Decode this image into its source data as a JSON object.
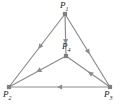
{
  "figure": {
    "type": "directed-graph",
    "caption": "",
    "background_color": "#ffffff",
    "edge_color": "#8d8d8d",
    "node_color": "#7f7f7f",
    "label_color": "#1a1a1a",
    "nodes": [
      {
        "id": "P1",
        "label_base": "P",
        "label_sub": "1",
        "x": 65,
        "y": 14
      },
      {
        "id": "P2",
        "label_base": "P",
        "label_sub": "2",
        "x": 9,
        "y": 87
      },
      {
        "id": "P3",
        "label_base": "P",
        "label_sub": "3",
        "x": 110,
        "y": 87
      },
      {
        "id": "P4",
        "label_base": "P",
        "label_sub": "4",
        "x": 66,
        "y": 56
      }
    ],
    "edges": [
      {
        "id": "e1",
        "from": "P1",
        "to": "P2",
        "directed": true,
        "arrow_t": 0.45
      },
      {
        "id": "e2",
        "from": "P1",
        "to": "P3",
        "directed": true,
        "arrow_t": 0.52
      },
      {
        "id": "e3",
        "from": "P1",
        "to": "P4",
        "directed": true,
        "arrow_t": 0.66
      },
      {
        "id": "e4",
        "from": "P3",
        "to": "P2",
        "directed": true,
        "arrow_t": 0.5
      },
      {
        "id": "e5",
        "from": "P3",
        "to": "P4",
        "directed": true,
        "arrow_t": 0.45
      },
      {
        "id": "e6",
        "from": "P4",
        "to": "P2",
        "directed": true,
        "arrow_t": 0.48
      }
    ]
  }
}
